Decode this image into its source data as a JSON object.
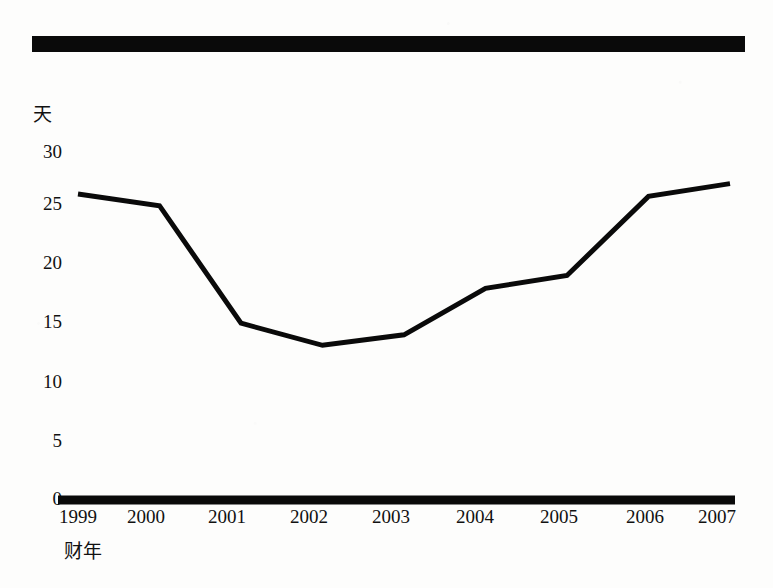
{
  "document": {
    "type": "scanned-figure",
    "background_color": "#fdfdfc",
    "ink_color": "#0a0a0a"
  },
  "rule_bar": {
    "label": "horizontal-rule"
  },
  "chart_data": {
    "type": "line",
    "title": "",
    "subtitle": "",
    "xlabel": "财年",
    "ylabel": "天",
    "categories": [
      "1999",
      "2000",
      "2001",
      "2002",
      "2003",
      "2004",
      "2005",
      "2006",
      "2007"
    ],
    "values": [
      26.3,
      25.3,
      15.2,
      13.3,
      14.2,
      18.2,
      19.3,
      26.1,
      27.2
    ],
    "series": [
      {
        "name": "天",
        "values": [
          26.3,
          25.3,
          15.2,
          13.3,
          14.2,
          18.2,
          19.3,
          26.1,
          27.2
        ]
      }
    ],
    "ylim": [
      0,
      30
    ],
    "yticks": [
      "0",
      "5",
      "10",
      "15",
      "20",
      "25",
      "30"
    ],
    "ytick_values": [
      0,
      5,
      10,
      15,
      20,
      25,
      30
    ],
    "grid": false,
    "legend": "none",
    "line_color": "#0a0a0a",
    "line_width": 5,
    "markers": false,
    "axis_color": "#0a0a0a"
  }
}
